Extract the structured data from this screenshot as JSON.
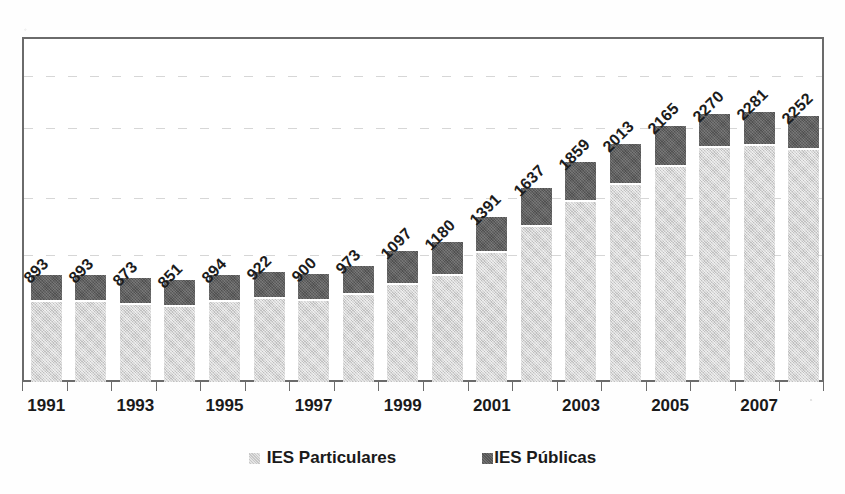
{
  "chart_data": {
    "type": "bar",
    "subtype": "stacked-bar",
    "title": "",
    "xlabel": "",
    "ylabel": "",
    "grid": true,
    "legend_position": "bottom",
    "ylim": [
      0,
      2940
    ],
    "gridline_values": [
      1055,
      1545,
      2140,
      2580
    ],
    "categories": [
      "1991",
      "1992",
      "1993",
      "1994",
      "1995",
      "1996",
      "1997",
      "1998",
      "1999",
      "2000",
      "2001",
      "2002",
      "2003",
      "2004",
      "2005",
      "2006",
      "2007",
      "2008"
    ],
    "xtick_labels": [
      "1991",
      "1993",
      "1995",
      "1997",
      "1999",
      "2001",
      "2003",
      "2005",
      "2007"
    ],
    "totals": [
      893,
      893,
      873,
      851,
      894,
      922,
      900,
      973,
      1097,
      1180,
      1391,
      1637,
      1859,
      2013,
      2165,
      2270,
      2281,
      2252
    ],
    "series": [
      {
        "name": "IES Particulares",
        "color": "#d2d2d2",
        "values": [
          680,
          680,
          660,
          640,
          681,
          709,
          687,
          739,
          831,
          902,
          1098,
          1324,
          1537,
          1683,
          1831,
          1998,
          2009,
          1980
        ]
      },
      {
        "name": "IES Públicas",
        "color": "#5b5b5b",
        "values": [
          213,
          213,
          213,
          211,
          213,
          213,
          213,
          234,
          266,
          278,
          293,
          313,
          322,
          330,
          334,
          272,
          272,
          272
        ]
      }
    ],
    "data_labels": [
      "893",
      "893",
      "873",
      "851",
      "894",
      "922",
      "900",
      "973",
      "1097",
      "1180",
      "1391",
      "1637",
      "1859",
      "2013",
      "2165",
      "2270",
      "2281",
      "2252"
    ],
    "data_label_rotation": -45
  },
  "legend": {
    "items": [
      {
        "label": "IES Particulares",
        "color": "#d2d2d2",
        "swatch": "light-gray-square"
      },
      {
        "label": "IES Públicas",
        "color": "#5b5b5b",
        "swatch": "dark-gray-square"
      }
    ]
  },
  "colors": {
    "particulares": "#d2d2d2",
    "publicas": "#5b5b5b",
    "axis": "#6b6b6b",
    "grid": "#cfcfcf",
    "text": "#1a1a1a",
    "background": "#ffffff"
  }
}
